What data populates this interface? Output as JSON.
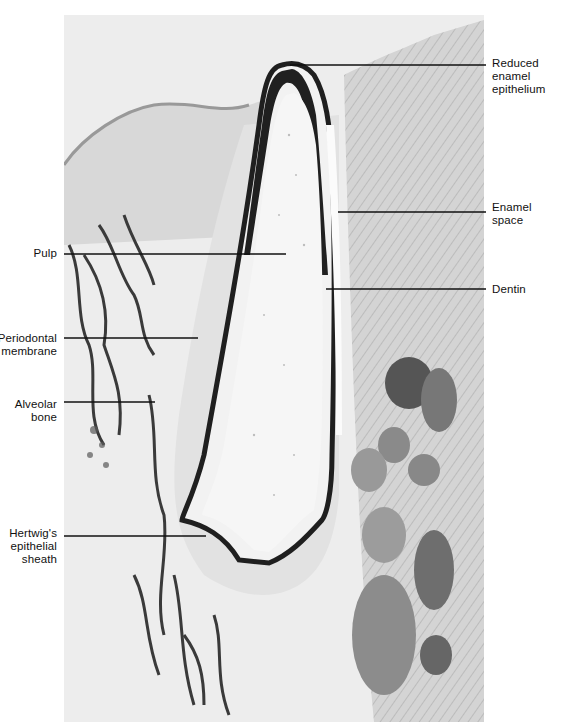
{
  "figure": {
    "type": "histology-micrograph",
    "background_color": "#ffffff",
    "micrograph_tone": "#ececec"
  },
  "labels": {
    "reduced_enamel_epithelium": "Reduced\nenamel\nepithelium",
    "enamel_space": "Enamel\nspace",
    "dentin": "Dentin",
    "pulp": "Pulp",
    "periodontal_membrane": "Periodontal\nmembrane",
    "alveolar_bone": "Alveolar\nbone",
    "hertwigs_epithelial_sheath": "Hertwig's\nepithelial\nsheath"
  },
  "leader_lines": [
    {
      "label": "reduced_enamel_epithelium",
      "x1": 290,
      "y1": 65,
      "x2": 486,
      "y2": 65
    },
    {
      "label": "enamel_space",
      "x1": 338,
      "y1": 212,
      "x2": 486,
      "y2": 212
    },
    {
      "label": "dentin",
      "x1": 326,
      "y1": 289,
      "x2": 486,
      "y2": 289
    },
    {
      "label": "pulp",
      "x1": 64,
      "y1": 254,
      "x2": 286,
      "y2": 254
    },
    {
      "label": "periodontal_membrane",
      "x1": 64,
      "y1": 338,
      "x2": 198,
      "y2": 338
    },
    {
      "label": "alveolar_bone",
      "x1": 64,
      "y1": 402,
      "x2": 155,
      "y2": 402
    },
    {
      "label": "hertwigs_epithelial_sheath",
      "x1": 64,
      "y1": 536,
      "x2": 206,
      "y2": 536
    }
  ]
}
